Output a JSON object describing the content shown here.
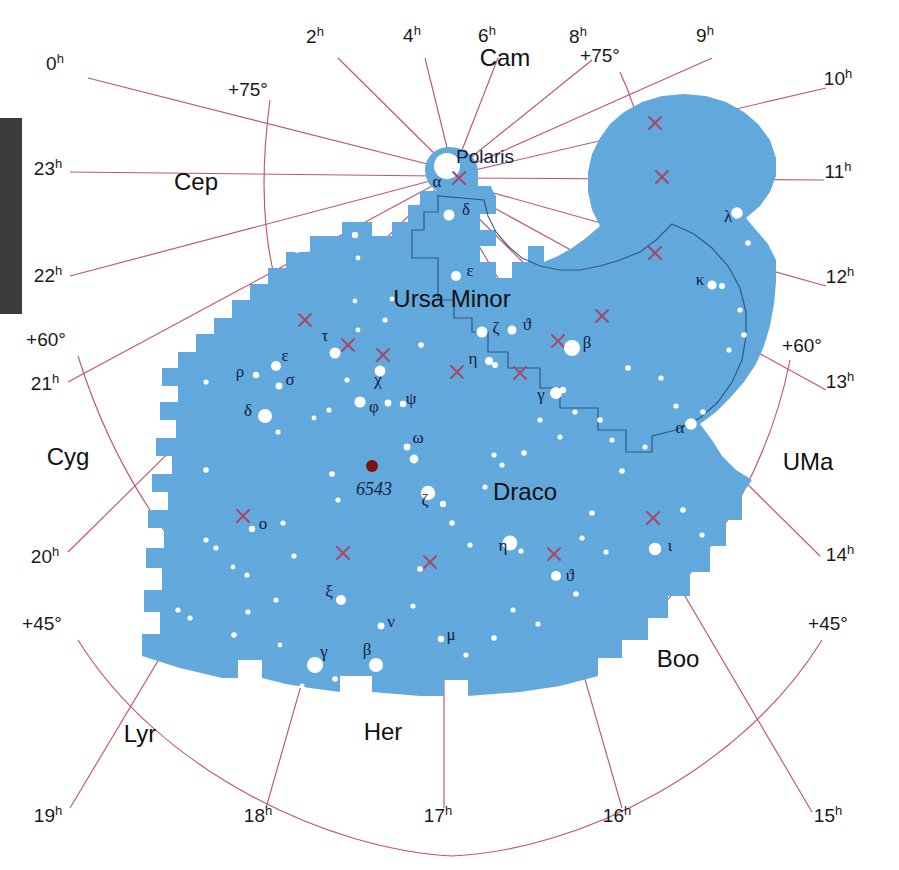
{
  "figure": {
    "type": "star-chart",
    "title_visible": false,
    "projection": "polar / north circumpolar",
    "background_color": "#ffffff",
    "region_fill_color": "#63a9dd",
    "grid_color": "#c0566e",
    "star_color": "#ffffff",
    "nebula_color": "#7d1414",
    "boundary_line_color": "#2a4a78",
    "margin_bar_color": "#3b3b3b"
  },
  "chart_data": {
    "type": "scatter",
    "xlabel": "Right Ascension (hours)",
    "ylabel": "Declination (degrees)",
    "grid": true,
    "legend": "none",
    "ra_ticks": [
      "0h",
      "2h",
      "4h",
      "6h",
      "8h",
      "9h",
      "10h",
      "11h",
      "12h",
      "13h",
      "14h",
      "15h",
      "16h",
      "17h",
      "18h",
      "19h",
      "20h",
      "21h",
      "22h",
      "23h"
    ],
    "dec_ticks": [
      "+75°",
      "+60°",
      "+45°"
    ],
    "highlighted_region": "Draco",
    "secondary_region": "Ursa Minor",
    "deep_sky_objects": [
      {
        "label": "6543",
        "type": "planetary-nebula",
        "color": "#7d1414"
      }
    ],
    "named_stars": [
      "Polaris"
    ],
    "bayer_labels_draco": [
      "α",
      "β",
      "γ",
      "δ",
      "ε",
      "ζ",
      "η",
      "θ",
      "ι",
      "κ",
      "λ",
      "μ",
      "ν",
      "ξ",
      "ο",
      "ρ",
      "σ",
      "τ",
      "φ",
      "χ",
      "ψ",
      "ω"
    ],
    "bayer_labels_ursa_minor": [
      "α",
      "β",
      "γ",
      "δ",
      "ε",
      "ζ",
      "η",
      "θ"
    ]
  },
  "ra_labels": [
    {
      "id": "ra-0h",
      "num": "0",
      "sup": "h",
      "x": 55,
      "y": 70
    },
    {
      "id": "ra-2h",
      "num": "2",
      "sup": "h",
      "x": 315,
      "y": 43
    },
    {
      "id": "ra-4h",
      "num": "4",
      "sup": "h",
      "x": 412,
      "y": 42
    },
    {
      "id": "ra-6h",
      "num": "6",
      "sup": "h",
      "x": 487,
      "y": 42
    },
    {
      "id": "ra-8h",
      "num": "8",
      "sup": "h",
      "x": 578,
      "y": 43
    },
    {
      "id": "ra-9h",
      "num": "9",
      "sup": "h",
      "x": 705,
      "y": 42
    },
    {
      "id": "ra-10h",
      "num": "10",
      "sup": "h",
      "x": 838,
      "y": 85
    },
    {
      "id": "ra-11h",
      "num": "11",
      "sup": "h",
      "x": 838,
      "y": 178
    },
    {
      "id": "ra-12h",
      "num": "12",
      "sup": "h",
      "x": 840,
      "y": 283
    },
    {
      "id": "ra-13h",
      "num": "13",
      "sup": "h",
      "x": 840,
      "y": 388
    },
    {
      "id": "ra-14h",
      "num": "14",
      "sup": "h",
      "x": 840,
      "y": 561
    },
    {
      "id": "ra-15h",
      "num": "15",
      "sup": "h",
      "x": 828,
      "y": 822
    },
    {
      "id": "ra-16h",
      "num": "16",
      "sup": "h",
      "x": 617,
      "y": 822
    },
    {
      "id": "ra-17h",
      "num": "17",
      "sup": "h",
      "x": 438,
      "y": 822
    },
    {
      "id": "ra-18h",
      "num": "18",
      "sup": "h",
      "x": 258,
      "y": 822
    },
    {
      "id": "ra-19h",
      "num": "19",
      "sup": "h",
      "x": 48,
      "y": 822
    },
    {
      "id": "ra-20h",
      "num": "20",
      "sup": "h",
      "x": 45,
      "y": 563
    },
    {
      "id": "ra-21h",
      "num": "21",
      "sup": "h",
      "x": 45,
      "y": 390
    },
    {
      "id": "ra-22h",
      "num": "22",
      "sup": "h",
      "x": 48,
      "y": 282
    },
    {
      "id": "ra-23h",
      "num": "23",
      "sup": "h",
      "x": 48,
      "y": 175
    }
  ],
  "dec_labels": [
    {
      "id": "dec-75-left",
      "text": "+75°",
      "x": 248,
      "y": 96
    },
    {
      "id": "dec-75-right",
      "text": "+75°",
      "x": 600,
      "y": 62
    },
    {
      "id": "dec-60-left",
      "text": "+60°",
      "x": 46,
      "y": 346
    },
    {
      "id": "dec-60-right",
      "text": "+60°",
      "x": 802,
      "y": 352
    },
    {
      "id": "dec-45-left",
      "text": "+45°",
      "x": 42,
      "y": 630
    },
    {
      "id": "dec-45-right",
      "text": "+45°",
      "x": 828,
      "y": 630
    }
  ],
  "constellation_names": [
    {
      "id": "con-cam",
      "text": "Cam",
      "x": 505,
      "y": 66,
      "size": 25
    },
    {
      "id": "con-cep",
      "text": "Cep",
      "x": 196,
      "y": 190,
      "size": 25
    },
    {
      "id": "con-cyg",
      "text": "Cyg",
      "x": 68,
      "y": 465,
      "size": 25
    },
    {
      "id": "con-lyr",
      "text": "Lyr",
      "x": 140,
      "y": 742,
      "size": 25
    },
    {
      "id": "con-her",
      "text": "Her",
      "x": 383,
      "y": 740,
      "size": 25
    },
    {
      "id": "con-boo",
      "text": "Boo",
      "x": 678,
      "y": 667,
      "size": 25
    },
    {
      "id": "con-uma",
      "text": "UMa",
      "x": 808,
      "y": 470,
      "size": 25
    },
    {
      "id": "con-draco",
      "text": "Draco",
      "x": 525,
      "y": 500,
      "size": 26
    },
    {
      "id": "con-umi",
      "text": "Ursa Minor",
      "x": 452,
      "y": 307,
      "size": 23
    }
  ],
  "star_name_labels": [
    {
      "id": "star-polaris",
      "text": "Polaris",
      "x": 456,
      "y": 163
    }
  ],
  "object_labels": [
    {
      "id": "obj-6543",
      "text": "6543",
      "x": 356,
      "y": 495
    }
  ],
  "greek_labels": [
    {
      "id": "g-umi-alpha",
      "text": "α",
      "x": 437,
      "y": 187
    },
    {
      "id": "g-umi-delta",
      "text": "δ",
      "x": 466,
      "y": 215
    },
    {
      "id": "g-umi-eps",
      "text": "ε",
      "x": 470,
      "y": 276
    },
    {
      "id": "g-umi-zeta",
      "text": "ζ",
      "x": 496,
      "y": 333
    },
    {
      "id": "g-umi-theta",
      "text": "ϑ",
      "x": 527,
      "y": 330
    },
    {
      "id": "g-umi-beta",
      "text": "β",
      "x": 587,
      "y": 348
    },
    {
      "id": "g-umi-eta",
      "text": "η",
      "x": 473,
      "y": 364
    },
    {
      "id": "g-umi-gamma",
      "text": "γ",
      "x": 541,
      "y": 400
    },
    {
      "id": "g-dra-tau",
      "text": "τ",
      "x": 325,
      "y": 341
    },
    {
      "id": "g-dra-rho",
      "text": "ρ",
      "x": 240,
      "y": 377
    },
    {
      "id": "g-dra-eps",
      "text": "ε",
      "x": 285,
      "y": 361
    },
    {
      "id": "g-dra-sigma",
      "text": "σ",
      "x": 290,
      "y": 385
    },
    {
      "id": "g-dra-delta",
      "text": "δ",
      "x": 248,
      "y": 416
    },
    {
      "id": "g-dra-chi",
      "text": "χ",
      "x": 378,
      "y": 385
    },
    {
      "id": "g-dra-phi",
      "text": "φ",
      "x": 374,
      "y": 412
    },
    {
      "id": "g-dra-psi",
      "text": "ψ",
      "x": 411,
      "y": 404
    },
    {
      "id": "g-dra-omega",
      "text": "ω",
      "x": 418,
      "y": 443
    },
    {
      "id": "g-dra-zeta",
      "text": "ζ",
      "x": 425,
      "y": 505
    },
    {
      "id": "g-dra-omicron",
      "text": "ο",
      "x": 263,
      "y": 529
    },
    {
      "id": "g-dra-xi",
      "text": "ξ",
      "x": 329,
      "y": 597
    },
    {
      "id": "g-dra-nu",
      "text": "ν",
      "x": 391,
      "y": 627
    },
    {
      "id": "g-dra-mu",
      "text": "μ",
      "x": 451,
      "y": 640
    },
    {
      "id": "g-dra-gamma",
      "text": "γ",
      "x": 324,
      "y": 657
    },
    {
      "id": "g-dra-beta",
      "text": "β",
      "x": 367,
      "y": 655
    },
    {
      "id": "g-dra-eta",
      "text": "η",
      "x": 503,
      "y": 551
    },
    {
      "id": "g-dra-theta",
      "text": "ϑ",
      "x": 570,
      "y": 581
    },
    {
      "id": "g-dra-iota",
      "text": "ι",
      "x": 670,
      "y": 551
    },
    {
      "id": "g-dra-alpha",
      "text": "α",
      "x": 680,
      "y": 433
    },
    {
      "id": "g-dra-kappa",
      "text": "κ",
      "x": 700,
      "y": 285
    },
    {
      "id": "g-dra-lambda",
      "text": "λ",
      "x": 728,
      "y": 222
    }
  ],
  "stars": [
    {
      "x": 447,
      "y": 166,
      "r": 7.5,
      "n": "polaris"
    },
    {
      "x": 449,
      "y": 215,
      "r": 5.5,
      "n": "umi-delta"
    },
    {
      "x": 456,
      "y": 276,
      "r": 5.0,
      "n": "umi-epsilon"
    },
    {
      "x": 482,
      "y": 332,
      "r": 5.5,
      "n": "umi-zeta"
    },
    {
      "x": 512,
      "y": 330,
      "r": 4.5,
      "n": "umi-theta"
    },
    {
      "x": 572,
      "y": 348,
      "r": 8.0,
      "n": "umi-beta"
    },
    {
      "x": 489,
      "y": 361,
      "r": 4.0,
      "n": "umi-eta"
    },
    {
      "x": 495,
      "y": 365,
      "r": 3.0,
      "n": "umi-eta-b"
    },
    {
      "x": 556,
      "y": 393,
      "r": 6.0,
      "n": "umi-gamma"
    },
    {
      "x": 563,
      "y": 390,
      "r": 3.2,
      "n": "umi-gamma-b"
    },
    {
      "x": 335,
      "y": 353,
      "r": 5.5,
      "n": "dra-tau"
    },
    {
      "x": 256,
      "y": 375,
      "r": 3.2,
      "n": "dra-rho"
    },
    {
      "x": 276,
      "y": 366,
      "r": 5.0,
      "n": "dra-epsilon"
    },
    {
      "x": 279,
      "y": 386,
      "r": 3.4,
      "n": "dra-sigma"
    },
    {
      "x": 265,
      "y": 416,
      "r": 7.0,
      "n": "dra-delta"
    },
    {
      "x": 380,
      "y": 371,
      "r": 5.4,
      "n": "dra-chi"
    },
    {
      "x": 360,
      "y": 402,
      "r": 5.6,
      "n": "dra-phi"
    },
    {
      "x": 388,
      "y": 403,
      "r": 3.4,
      "n": "dra-psi-a"
    },
    {
      "x": 403,
      "y": 404,
      "r": 3.2,
      "n": "dra-psi-b"
    },
    {
      "x": 407,
      "y": 447,
      "r": 3.4,
      "n": "dra-omega-a"
    },
    {
      "x": 414,
      "y": 459,
      "r": 4.4,
      "n": "dra-omega-b"
    },
    {
      "x": 428,
      "y": 493,
      "r": 7.2,
      "n": "dra-zeta"
    },
    {
      "x": 443,
      "y": 504,
      "r": 3.2,
      "n": "dra-zeta-b"
    },
    {
      "x": 252,
      "y": 529,
      "r": 3.2,
      "n": "dra-omicron"
    },
    {
      "x": 341,
      "y": 600,
      "r": 5.0,
      "n": "dra-xi"
    },
    {
      "x": 381,
      "y": 626,
      "r": 3.4,
      "n": "dra-nu"
    },
    {
      "x": 441,
      "y": 639,
      "r": 3.2,
      "n": "dra-mu"
    },
    {
      "x": 315,
      "y": 665,
      "r": 8.0,
      "n": "dra-gamma"
    },
    {
      "x": 376,
      "y": 665,
      "r": 7.0,
      "n": "dra-beta"
    },
    {
      "x": 510,
      "y": 543,
      "r": 7.4,
      "n": "dra-eta"
    },
    {
      "x": 556,
      "y": 576,
      "r": 5.0,
      "n": "dra-theta"
    },
    {
      "x": 655,
      "y": 549,
      "r": 6.2,
      "n": "dra-iota"
    },
    {
      "x": 691,
      "y": 424,
      "r": 5.8,
      "n": "dra-alpha"
    },
    {
      "x": 712,
      "y": 285,
      "r": 4.6,
      "n": "dra-kappa"
    },
    {
      "x": 722,
      "y": 286,
      "r": 3.0,
      "n": "dra-kappa-b"
    },
    {
      "x": 737,
      "y": 213,
      "r": 5.8,
      "n": "dra-lambda"
    },
    {
      "x": 285,
      "y": 245,
      "r": 2.6,
      "n": "f01"
    },
    {
      "x": 297,
      "y": 250,
      "r": 3.0,
      "n": "f02"
    },
    {
      "x": 355,
      "y": 235,
      "r": 3.2,
      "n": "f03"
    },
    {
      "x": 358,
      "y": 258,
      "r": 2.4,
      "n": "f04"
    },
    {
      "x": 392,
      "y": 299,
      "r": 2.4,
      "n": "f05"
    },
    {
      "x": 385,
      "y": 320,
      "r": 2.6,
      "n": "f06"
    },
    {
      "x": 355,
      "y": 301,
      "r": 2.4,
      "n": "f07"
    },
    {
      "x": 421,
      "y": 345,
      "r": 2.8,
      "n": "f08"
    },
    {
      "x": 358,
      "y": 330,
      "r": 2.4,
      "n": "f09"
    },
    {
      "x": 347,
      "y": 380,
      "r": 2.6,
      "n": "f10"
    },
    {
      "x": 329,
      "y": 410,
      "r": 2.6,
      "n": "f11"
    },
    {
      "x": 314,
      "y": 418,
      "r": 2.4,
      "n": "f12"
    },
    {
      "x": 278,
      "y": 432,
      "r": 2.6,
      "n": "f13"
    },
    {
      "x": 206,
      "y": 382,
      "r": 2.6,
      "n": "f14"
    },
    {
      "x": 206,
      "y": 470,
      "r": 2.8,
      "n": "f15"
    },
    {
      "x": 332,
      "y": 474,
      "r": 2.8,
      "n": "f16"
    },
    {
      "x": 338,
      "y": 500,
      "r": 2.6,
      "n": "f17"
    },
    {
      "x": 283,
      "y": 523,
      "r": 2.6,
      "n": "f18"
    },
    {
      "x": 206,
      "y": 540,
      "r": 2.6,
      "n": "f19"
    },
    {
      "x": 216,
      "y": 548,
      "r": 2.6,
      "n": "f20"
    },
    {
      "x": 233,
      "y": 567,
      "r": 2.4,
      "n": "f21"
    },
    {
      "x": 247,
      "y": 575,
      "r": 2.6,
      "n": "f22"
    },
    {
      "x": 294,
      "y": 556,
      "r": 2.6,
      "n": "f23"
    },
    {
      "x": 276,
      "y": 600,
      "r": 2.6,
      "n": "f24"
    },
    {
      "x": 248,
      "y": 612,
      "r": 2.6,
      "n": "f25"
    },
    {
      "x": 234,
      "y": 635,
      "r": 2.8,
      "n": "f26"
    },
    {
      "x": 178,
      "y": 610,
      "r": 2.6,
      "n": "f27"
    },
    {
      "x": 190,
      "y": 618,
      "r": 2.6,
      "n": "f28"
    },
    {
      "x": 280,
      "y": 645,
      "r": 2.4,
      "n": "f29"
    },
    {
      "x": 244,
      "y": 670,
      "r": 2.6,
      "n": "f30"
    },
    {
      "x": 257,
      "y": 672,
      "r": 2.4,
      "n": "f31"
    },
    {
      "x": 302,
      "y": 686,
      "r": 2.6,
      "n": "f32"
    },
    {
      "x": 335,
      "y": 679,
      "r": 2.8,
      "n": "f33"
    },
    {
      "x": 413,
      "y": 606,
      "r": 2.6,
      "n": "f34"
    },
    {
      "x": 420,
      "y": 569,
      "r": 2.8,
      "n": "f35"
    },
    {
      "x": 452,
      "y": 523,
      "r": 2.8,
      "n": "f36"
    },
    {
      "x": 470,
      "y": 545,
      "r": 2.6,
      "n": "f37"
    },
    {
      "x": 485,
      "y": 487,
      "r": 2.6,
      "n": "f38"
    },
    {
      "x": 494,
      "y": 455,
      "r": 2.6,
      "n": "f39"
    },
    {
      "x": 502,
      "y": 465,
      "r": 2.6,
      "n": "f40"
    },
    {
      "x": 524,
      "y": 453,
      "r": 2.8,
      "n": "f41"
    },
    {
      "x": 521,
      "y": 551,
      "r": 2.6,
      "n": "f42"
    },
    {
      "x": 466,
      "y": 655,
      "r": 2.6,
      "n": "f43"
    },
    {
      "x": 494,
      "y": 638,
      "r": 2.8,
      "n": "f44"
    },
    {
      "x": 513,
      "y": 610,
      "r": 2.6,
      "n": "f45"
    },
    {
      "x": 538,
      "y": 624,
      "r": 2.6,
      "n": "f46"
    },
    {
      "x": 576,
      "y": 594,
      "r": 2.8,
      "n": "f47"
    },
    {
      "x": 582,
      "y": 538,
      "r": 2.6,
      "n": "f48"
    },
    {
      "x": 592,
      "y": 513,
      "r": 2.8,
      "n": "f49"
    },
    {
      "x": 606,
      "y": 552,
      "r": 2.6,
      "n": "f50"
    },
    {
      "x": 622,
      "y": 471,
      "r": 2.8,
      "n": "f51"
    },
    {
      "x": 645,
      "y": 447,
      "r": 2.6,
      "n": "f52"
    },
    {
      "x": 612,
      "y": 440,
      "r": 2.6,
      "n": "f53"
    },
    {
      "x": 600,
      "y": 420,
      "r": 2.8,
      "n": "f54"
    },
    {
      "x": 575,
      "y": 412,
      "r": 2.6,
      "n": "f55"
    },
    {
      "x": 560,
      "y": 437,
      "r": 2.6,
      "n": "f56"
    },
    {
      "x": 540,
      "y": 420,
      "r": 2.6,
      "n": "f57"
    },
    {
      "x": 628,
      "y": 368,
      "r": 2.8,
      "n": "f58"
    },
    {
      "x": 740,
      "y": 310,
      "r": 2.6,
      "n": "f59"
    },
    {
      "x": 744,
      "y": 335,
      "r": 2.8,
      "n": "f60"
    },
    {
      "x": 729,
      "y": 350,
      "r": 2.6,
      "n": "f61"
    },
    {
      "x": 748,
      "y": 243,
      "r": 2.8,
      "n": "f62"
    },
    {
      "x": 703,
      "y": 412,
      "r": 2.8,
      "n": "f63"
    },
    {
      "x": 676,
      "y": 406,
      "r": 2.6,
      "n": "f64"
    },
    {
      "x": 661,
      "y": 378,
      "r": 2.6,
      "n": "f65"
    },
    {
      "x": 702,
      "y": 535,
      "r": 2.6,
      "n": "f66"
    },
    {
      "x": 683,
      "y": 510,
      "r": 2.8,
      "n": "f67"
    }
  ],
  "grid_crosses": [
    {
      "x": 459,
      "y": 178
    },
    {
      "x": 655,
      "y": 123
    },
    {
      "x": 662,
      "y": 177
    },
    {
      "x": 655,
      "y": 253
    },
    {
      "x": 602,
      "y": 316
    },
    {
      "x": 558,
      "y": 341
    },
    {
      "x": 520,
      "y": 373
    },
    {
      "x": 457,
      "y": 372
    },
    {
      "x": 348,
      "y": 345
    },
    {
      "x": 305,
      "y": 320
    },
    {
      "x": 383,
      "y": 355
    },
    {
      "x": 243,
      "y": 516
    },
    {
      "x": 343,
      "y": 553
    },
    {
      "x": 430,
      "y": 562
    },
    {
      "x": 554,
      "y": 554
    },
    {
      "x": 653,
      "y": 518
    }
  ],
  "margin_bar": {
    "x": 0,
    "y": 118,
    "width": 22,
    "height": 196,
    "color": "#3b3b3b"
  }
}
